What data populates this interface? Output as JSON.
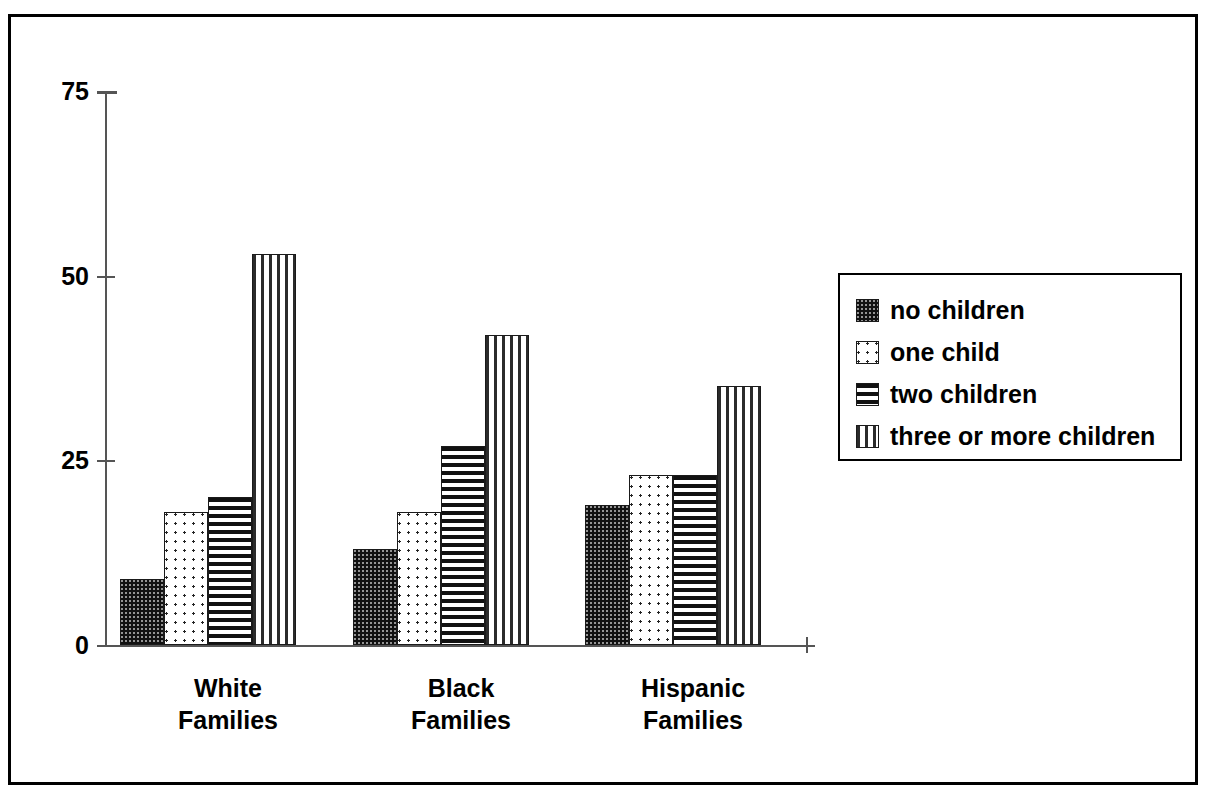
{
  "chart_data": {
    "type": "bar",
    "title": "",
    "subtitle": "",
    "xlabel": "",
    "ylabel": "",
    "ylim": [
      0,
      75
    ],
    "yticks": [
      0,
      25,
      50,
      75
    ],
    "ytick_labels": [
      "0",
      "25",
      "50",
      "75"
    ],
    "grid": false,
    "legend_position": "right",
    "categories": [
      "White Families",
      "Black Families",
      "Hispanic Families"
    ],
    "category_lines": [
      [
        "White",
        "Families"
      ],
      [
        "Black",
        "Families"
      ],
      [
        "Hispanic",
        "Families"
      ]
    ],
    "series": [
      {
        "name": "no children",
        "pattern": "dense-dots",
        "values": [
          9,
          13,
          19
        ]
      },
      {
        "name": "one child",
        "pattern": "sparse-dots",
        "values": [
          18,
          18,
          23
        ]
      },
      {
        "name": "two children",
        "pattern": "horizontal-lines",
        "values": [
          20,
          27,
          23
        ]
      },
      {
        "name": "three or more children",
        "pattern": "vertical-lines",
        "values": [
          53,
          42,
          35
        ]
      }
    ]
  },
  "legend": {
    "items": [
      {
        "label": "no children",
        "swatch": "dense-dots-swatch"
      },
      {
        "label": "one child",
        "swatch": "sparse-dots-swatch"
      },
      {
        "label": "two children",
        "swatch": "horizontal-lines-swatch"
      },
      {
        "label": "three or more children",
        "swatch": "vertical-lines-swatch"
      }
    ]
  },
  "axis": {
    "y_labels": [
      "75",
      "50",
      "25",
      "0"
    ]
  },
  "colors": {
    "frame": "#000000",
    "axis": "#555555",
    "ink": "#111111",
    "background": "#ffffff"
  }
}
